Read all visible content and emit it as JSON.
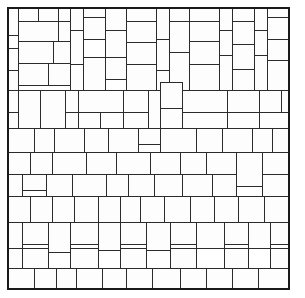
{
  "figure": {
    "kind": "rectangle-packing",
    "canvas": {
      "width": 305,
      "height": 298
    },
    "frame": {
      "x": 8,
      "y": 8,
      "width": 281,
      "height": 281
    },
    "colors": {
      "background": "#ffffff",
      "tile_fill": "#fdfdfd",
      "tile_stroke": "#2b2b2b",
      "frame_stroke": "#1a1a1a"
    },
    "tile_count": 171,
    "tiles": [
      [
        8,
        8,
        10,
        27
      ],
      [
        18,
        8,
        20,
        13
      ],
      [
        38,
        8,
        20,
        13
      ],
      [
        58,
        8,
        12,
        13
      ],
      [
        70,
        8,
        13,
        22
      ],
      [
        83,
        8,
        22,
        9
      ],
      [
        105,
        8,
        21,
        22
      ],
      [
        126,
        8,
        30,
        13
      ],
      [
        156,
        8,
        13,
        31
      ],
      [
        169,
        8,
        20,
        13
      ],
      [
        189,
        8,
        30,
        13
      ],
      [
        219,
        8,
        13,
        22
      ],
      [
        232,
        8,
        22,
        13
      ],
      [
        254,
        8,
        13,
        22
      ],
      [
        267,
        8,
        22,
        9
      ],
      [
        18,
        21,
        40,
        20
      ],
      [
        38,
        21,
        0,
        0
      ],
      [
        58,
        21,
        12,
        21
      ],
      [
        83,
        17,
        22,
        22
      ],
      [
        126,
        21,
        30,
        21
      ],
      [
        169,
        21,
        20,
        31
      ],
      [
        189,
        21,
        30,
        20
      ],
      [
        232,
        21,
        22,
        23
      ],
      [
        267,
        17,
        22,
        22
      ],
      [
        8,
        35,
        10,
        13
      ],
      [
        8,
        48,
        10,
        22
      ],
      [
        70,
        30,
        13,
        34
      ],
      [
        105,
        30,
        21,
        27
      ],
      [
        156,
        39,
        13,
        31
      ],
      [
        219,
        30,
        13,
        25
      ],
      [
        254,
        30,
        13,
        25
      ],
      [
        18,
        41,
        35,
        22
      ],
      [
        53,
        41,
        17,
        22
      ],
      [
        126,
        42,
        30,
        22
      ],
      [
        189,
        41,
        30,
        23
      ],
      [
        232,
        44,
        22,
        25
      ],
      [
        267,
        39,
        22,
        21
      ],
      [
        8,
        70,
        10,
        20
      ],
      [
        18,
        63,
        30,
        22
      ],
      [
        48,
        63,
        22,
        22
      ],
      [
        70,
        64,
        13,
        27
      ],
      [
        83,
        57,
        22,
        34
      ],
      [
        105,
        57,
        21,
        22
      ],
      [
        126,
        64,
        30,
        27
      ],
      [
        156,
        70,
        13,
        22
      ],
      [
        169,
        52,
        20,
        39
      ],
      [
        189,
        64,
        30,
        27
      ],
      [
        219,
        55,
        13,
        36
      ],
      [
        232,
        69,
        22,
        22
      ],
      [
        254,
        55,
        13,
        36
      ],
      [
        267,
        60,
        22,
        31
      ]
    ],
    "rows": [
      {
        "label": "band-1",
        "y": 8,
        "height": 82
      },
      {
        "label": "band-2",
        "y": 90,
        "height": 62
      },
      {
        "label": "band-3",
        "y": 152,
        "height": 68
      },
      {
        "label": "band-4",
        "y": 220,
        "height": 69
      }
    ],
    "bands": {
      "band2_tiles": [
        [
          8,
          90,
          10,
          22
        ],
        [
          18,
          90,
          22,
          38
        ],
        [
          40,
          90,
          25,
          38
        ],
        [
          65,
          90,
          13,
          22
        ],
        [
          78,
          90,
          45,
          22
        ],
        [
          123,
          90,
          25,
          22
        ],
        [
          148,
          90,
          12,
          38
        ],
        [
          160,
          82,
          22,
          26
        ],
        [
          160,
          108,
          22,
          20
        ],
        [
          182,
          90,
          45,
          22
        ],
        [
          227,
          90,
          32,
          22
        ],
        [
          259,
          90,
          22,
          22
        ],
        [
          281,
          90,
          8,
          22
        ],
        [
          8,
          112,
          10,
          16
        ],
        [
          65,
          112,
          13,
          16
        ],
        [
          78,
          112,
          22,
          16
        ],
        [
          100,
          112,
          23,
          16
        ],
        [
          123,
          112,
          25,
          16
        ],
        [
          182,
          112,
          45,
          16
        ],
        [
          227,
          112,
          32,
          16
        ],
        [
          259,
          112,
          30,
          16
        ],
        [
          8,
          128,
          26,
          24
        ],
        [
          34,
          128,
          20,
          24
        ],
        [
          54,
          128,
          30,
          24
        ],
        [
          84,
          128,
          24,
          24
        ],
        [
          108,
          128,
          30,
          24
        ],
        [
          138,
          128,
          22,
          16
        ],
        [
          138,
          144,
          22,
          8
        ],
        [
          160,
          128,
          36,
          24
        ],
        [
          196,
          128,
          26,
          24
        ],
        [
          222,
          128,
          30,
          24
        ],
        [
          252,
          128,
          20,
          24
        ],
        [
          272,
          128,
          17,
          24
        ]
      ],
      "band3_tiles": [
        [
          8,
          152,
          22,
          22
        ],
        [
          30,
          152,
          22,
          22
        ],
        [
          52,
          152,
          34,
          22
        ],
        [
          86,
          152,
          30,
          22
        ],
        [
          116,
          152,
          34,
          22
        ],
        [
          150,
          152,
          30,
          22
        ],
        [
          180,
          152,
          26,
          22
        ],
        [
          206,
          152,
          30,
          22
        ],
        [
          236,
          152,
          26,
          34
        ],
        [
          262,
          152,
          27,
          22
        ],
        [
          8,
          174,
          14,
          22
        ],
        [
          22,
          174,
          24,
          16
        ],
        [
          46,
          174,
          26,
          22
        ],
        [
          72,
          174,
          34,
          22
        ],
        [
          106,
          174,
          22,
          34
        ],
        [
          128,
          174,
          26,
          22
        ],
        [
          154,
          174,
          28,
          22
        ],
        [
          182,
          174,
          30,
          22
        ],
        [
          212,
          174,
          24,
          22
        ],
        [
          262,
          174,
          27,
          22
        ],
        [
          8,
          196,
          22,
          26
        ],
        [
          30,
          196,
          22,
          38
        ],
        [
          52,
          196,
          22,
          30
        ],
        [
          74,
          196,
          24,
          26
        ],
        [
          98,
          196,
          22,
          26
        ],
        [
          120,
          196,
          20,
          26
        ],
        [
          140,
          196,
          24,
          26
        ],
        [
          164,
          196,
          26,
          30
        ],
        [
          190,
          196,
          24,
          26
        ],
        [
          214,
          196,
          24,
          26
        ],
        [
          238,
          196,
          26,
          26
        ],
        [
          264,
          196,
          25,
          26
        ]
      ],
      "band4_tiles": [
        [
          8,
          222,
          14,
          26
        ],
        [
          22,
          222,
          26,
          22
        ],
        [
          48,
          222,
          22,
          30
        ],
        [
          70,
          222,
          28,
          22
        ],
        [
          98,
          222,
          22,
          28
        ],
        [
          120,
          222,
          26,
          22
        ],
        [
          146,
          222,
          24,
          28
        ],
        [
          170,
          222,
          26,
          22
        ],
        [
          196,
          222,
          28,
          26
        ],
        [
          224,
          222,
          24,
          22
        ],
        [
          248,
          222,
          22,
          26
        ],
        [
          270,
          222,
          19,
          22
        ],
        [
          8,
          248,
          14,
          20
        ],
        [
          22,
          248,
          26,
          20
        ],
        [
          70,
          248,
          28,
          22
        ],
        [
          120,
          248,
          26,
          22
        ],
        [
          170,
          248,
          26,
          22
        ],
        [
          224,
          248,
          24,
          24
        ],
        [
          270,
          248,
          19,
          22
        ],
        [
          8,
          268,
          26,
          21
        ],
        [
          34,
          268,
          22,
          21
        ],
        [
          56,
          268,
          20,
          21
        ],
        [
          76,
          268,
          26,
          21
        ],
        [
          102,
          268,
          24,
          21
        ],
        [
          126,
          268,
          26,
          21
        ],
        [
          152,
          268,
          28,
          21
        ],
        [
          180,
          268,
          26,
          21
        ],
        [
          206,
          268,
          26,
          21
        ],
        [
          232,
          268,
          26,
          21
        ],
        [
          258,
          268,
          31,
          21
        ]
      ]
    }
  }
}
